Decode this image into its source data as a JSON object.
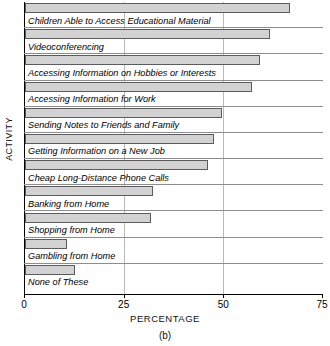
{
  "chart_data": {
    "type": "bar",
    "orientation": "horizontal",
    "title": "",
    "xlabel": "PERCENTAGE",
    "ylabel": "ACTIVITY",
    "caption": "(b)",
    "xlim": [
      0,
      75
    ],
    "xticks": [
      0,
      25,
      50,
      75
    ],
    "xtick_labels": [
      "0",
      "25",
      "50",
      "75"
    ],
    "grid": "vertical gridlines at 25 and 50",
    "legend": "none",
    "bar_color": "#d2d2d2",
    "bar_edge_color": "#5c5c5c",
    "categories": [
      "Children Able to Access Educational Material",
      "Videoconferencing",
      "Accessing Information on Hobbies or Interests",
      "Accessing Information for Work",
      "Sending Notes to Friends and Family",
      "Getting Information on a New Job",
      "Cheap Long-Distance Phone Calls",
      "Banking from Home",
      "Shopping from Home",
      "Gambling from Home",
      "None of These"
    ],
    "values": [
      66.5,
      61.5,
      59,
      57,
      49.5,
      47.5,
      46,
      32,
      31.5,
      10.5,
      12.5
    ]
  }
}
